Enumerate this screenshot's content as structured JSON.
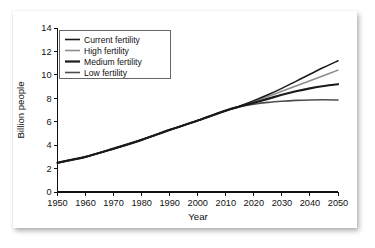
{
  "chart_data": {
    "type": "line",
    "title": "",
    "xlabel": "Year",
    "ylabel": "Billion people",
    "xlim": [
      1950,
      2050
    ],
    "ylim": [
      0,
      14
    ],
    "xticks": [
      1950,
      1960,
      1970,
      1980,
      1990,
      2000,
      2010,
      2020,
      2030,
      2040,
      2050
    ],
    "yticks": [
      0,
      2,
      4,
      6,
      8,
      10,
      12,
      14
    ],
    "grid": false,
    "legend_position": "top-left",
    "x": [
      1950,
      1960,
      1970,
      1980,
      1990,
      2000,
      2010,
      2015,
      2020,
      2025,
      2030,
      2035,
      2040,
      2045,
      2050
    ],
    "series": [
      {
        "name": "Current fertility",
        "color": "#1a1a1a",
        "width": 1.5,
        "values": [
          2.5,
          3.0,
          3.7,
          4.45,
          5.3,
          6.1,
          6.95,
          7.35,
          7.8,
          8.3,
          8.85,
          9.45,
          10.05,
          10.65,
          11.2
        ]
      },
      {
        "name": "High fertility",
        "color": "#8c8c8c",
        "width": 1.5,
        "values": [
          2.5,
          3.0,
          3.7,
          4.45,
          5.3,
          6.1,
          6.95,
          7.33,
          7.72,
          8.15,
          8.6,
          9.05,
          9.5,
          9.95,
          10.4
        ]
      },
      {
        "name": "Medium fertility",
        "color": "#1a1a1a",
        "width": 2.2,
        "values": [
          2.5,
          3.0,
          3.7,
          4.45,
          5.3,
          6.1,
          6.95,
          7.3,
          7.62,
          7.95,
          8.3,
          8.6,
          8.85,
          9.05,
          9.2
        ]
      },
      {
        "name": "Low fertility",
        "color": "#4d4d4d",
        "width": 1.6,
        "values": [
          2.5,
          3.0,
          3.7,
          4.45,
          5.3,
          6.1,
          6.95,
          7.28,
          7.5,
          7.65,
          7.75,
          7.82,
          7.86,
          7.87,
          7.85
        ]
      }
    ]
  },
  "legend": {
    "entries": [
      {
        "label": "Current fertility"
      },
      {
        "label": "High fertility"
      },
      {
        "label": "Medium fertility"
      },
      {
        "label": "Low fertility"
      }
    ]
  },
  "colors": {
    "card_background": "#ffffff",
    "page_background": "#ffffff",
    "axis": "#111111",
    "text": "#111111",
    "legend_border": "#555555"
  }
}
